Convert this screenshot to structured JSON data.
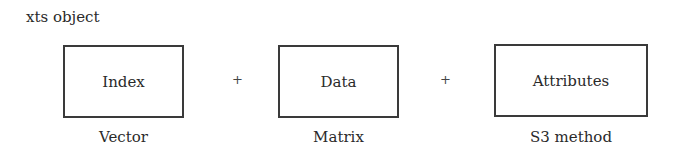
{
  "title": "xts object",
  "components": [
    {
      "label": "Index",
      "caption": "Vector"
    },
    {
      "label": "Data",
      "caption": "Matrix"
    },
    {
      "label": "Attributes",
      "caption": "S3 method"
    }
  ],
  "operators": [
    "+",
    "+"
  ]
}
